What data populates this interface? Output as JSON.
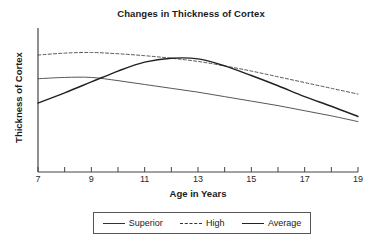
{
  "chart_data": {
    "type": "line",
    "title": "Changes in Thickness of Cortex",
    "xlabel": "Age in Years",
    "ylabel": "Thickness of Cortex",
    "xlim": [
      7,
      19
    ],
    "ylim": [
      0,
      10
    ],
    "grid": false,
    "legend_position": "bottom",
    "xticks": [
      7,
      8,
      9,
      10,
      11,
      12,
      13,
      14,
      15,
      16,
      17,
      18,
      19
    ],
    "xtick_labels": [
      "7",
      "",
      "9",
      "",
      "11",
      "",
      "13",
      "",
      "15",
      "",
      "17",
      "",
      "19"
    ],
    "yticks": [],
    "ytick_labels": [],
    "series": [
      {
        "name": "Superior",
        "style": "solid-thin",
        "color": "#444444",
        "x": [
          7,
          8,
          9,
          10,
          11,
          12,
          13,
          14,
          15,
          16,
          17,
          18,
          19
        ],
        "values": [
          6.35,
          6.45,
          6.45,
          6.2,
          5.9,
          5.6,
          5.3,
          4.95,
          4.6,
          4.25,
          3.85,
          3.45,
          3.0
        ]
      },
      {
        "name": "High",
        "style": "dashed",
        "color": "#555555",
        "x": [
          7,
          8,
          9,
          10,
          11,
          12,
          13,
          14,
          15,
          16,
          17,
          18,
          19
        ],
        "values": [
          8.2,
          8.35,
          8.4,
          8.3,
          8.15,
          7.95,
          7.7,
          7.35,
          6.95,
          6.5,
          6.05,
          5.6,
          5.15
        ]
      },
      {
        "name": "Average",
        "style": "solid-thick",
        "color": "#222222",
        "x": [
          7,
          8,
          9,
          10,
          11,
          12,
          13,
          14,
          15,
          16,
          17,
          18,
          19
        ],
        "values": [
          4.45,
          5.25,
          6.1,
          6.95,
          7.65,
          7.95,
          7.9,
          7.35,
          6.6,
          5.8,
          4.95,
          4.2,
          3.4
        ]
      }
    ]
  },
  "legend": {
    "items": [
      {
        "label": "Superior",
        "style": "solid-thin"
      },
      {
        "label": "High",
        "style": "dashed"
      },
      {
        "label": "Average",
        "style": "solid-thick"
      }
    ]
  }
}
